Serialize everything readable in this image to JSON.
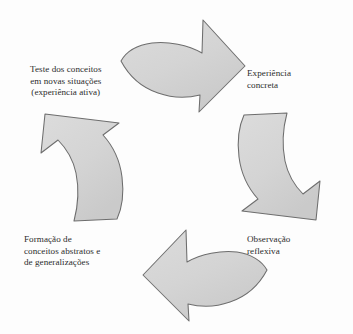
{
  "diagram": {
    "type": "cycle",
    "title": "",
    "orientation": "clockwise",
    "arrow_fill_color": "#d5d5d5",
    "arrow_stroke_color": "#6b6b6b",
    "text_color": "#2b2b2b",
    "background_color": "#fdfdfd",
    "stages": [
      {
        "id": "concrete-experience",
        "position": "top-right",
        "lines": [
          "Experiência",
          "concreta"
        ]
      },
      {
        "id": "reflective-observation",
        "position": "bottom-right",
        "lines": [
          "Observação",
          "reflexiva"
        ]
      },
      {
        "id": "abstract-conceptualization",
        "position": "bottom-left",
        "lines": [
          "Formação de",
          "conceitos abstratos e",
          "de generalizações"
        ]
      },
      {
        "id": "active-experimentation",
        "position": "top-left",
        "lines": [
          "Teste dos conceitos",
          "em novas situações",
          "(experiência ativa)"
        ]
      }
    ],
    "arrows": [
      {
        "id": "arrow-top",
        "direction": "right-down",
        "from": "active-experimentation",
        "to": "concrete-experience"
      },
      {
        "id": "arrow-right",
        "direction": "down-left",
        "from": "concrete-experience",
        "to": "reflective-observation"
      },
      {
        "id": "arrow-bottom",
        "direction": "left-up",
        "from": "reflective-observation",
        "to": "abstract-conceptualization"
      },
      {
        "id": "arrow-left",
        "direction": "up-right",
        "from": "abstract-conceptualization",
        "to": "active-experimentation"
      }
    ]
  }
}
